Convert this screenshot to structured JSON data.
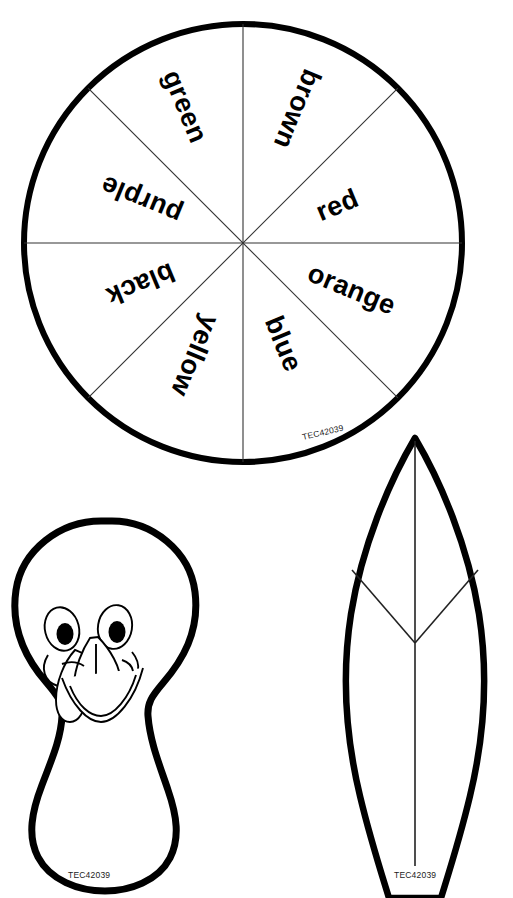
{
  "page": {
    "faint_header_text": "",
    "background_color": "#ffffff",
    "ink_color": "#000000",
    "width": 513,
    "height": 898
  },
  "spinner": {
    "name": "color-spinner-wheel",
    "center_x": 243,
    "center_y": 243,
    "radius": 221,
    "sector_count": 8,
    "sectors": [
      {
        "label": "brown",
        "index": 0,
        "start_deg": -90,
        "end_deg": -45,
        "mid_deg": -67.5,
        "text_rotation_deg": -67.5
      },
      {
        "label": "red",
        "index": 1,
        "start_deg": -45,
        "end_deg": 0,
        "mid_deg": -22.5,
        "text_rotation_deg": -22.5
      },
      {
        "label": "orange",
        "index": 2,
        "start_deg": 0,
        "end_deg": 45,
        "mid_deg": 22.5,
        "text_rotation_deg": 22.5
      },
      {
        "label": "blue",
        "index": 3,
        "start_deg": 45,
        "end_deg": 90,
        "mid_deg": 67.5,
        "text_rotation_deg": 67.5
      },
      {
        "label": "yellow",
        "index": 4,
        "start_deg": 90,
        "end_deg": 135,
        "mid_deg": 112.5,
        "text_rotation_deg": 112.5
      },
      {
        "label": "black",
        "index": 5,
        "start_deg": 135,
        "end_deg": 180,
        "mid_deg": 157.5,
        "text_rotation_deg": 157.5
      },
      {
        "label": "purple",
        "index": 6,
        "start_deg": 180,
        "end_deg": 225,
        "mid_deg": 202.5,
        "text_rotation_deg": 202.5
      },
      {
        "label": "green",
        "index": 7,
        "start_deg": 225,
        "end_deg": 270,
        "mid_deg": 247.5,
        "text_rotation_deg": 247.5
      }
    ],
    "code": "TEC42039"
  },
  "turkey_body": {
    "name": "turkey-body-pattern",
    "code": "TEC42039",
    "description": "turkey head and body cut-out with face"
  },
  "feather": {
    "name": "turkey-feather-pattern",
    "code": "TEC42039",
    "description": "pointed feather cut-out with center spine and V detail lines"
  }
}
